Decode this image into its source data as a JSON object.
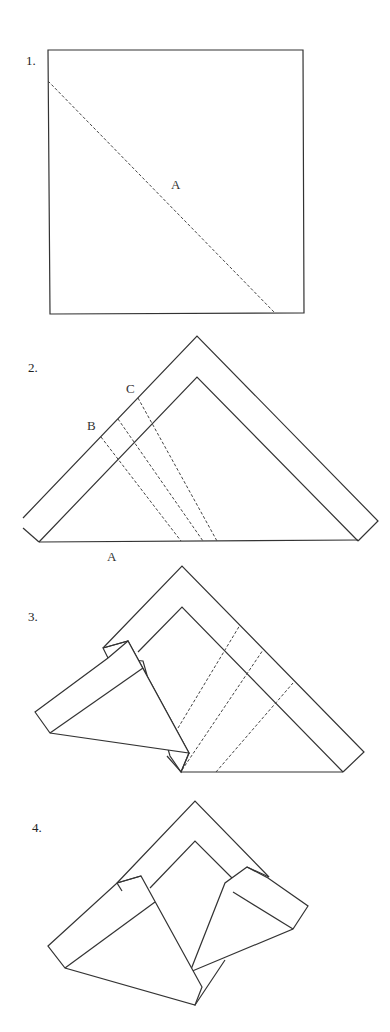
{
  "steps": [
    {
      "number": "1.",
      "labels": {
        "fold_a": "A"
      },
      "description": "Square with diagonal valley fold line A"
    },
    {
      "number": "2.",
      "labels": {
        "fold_a": "A",
        "fold_b": "B",
        "fold_c": "C"
      },
      "description": "Triangle folded along A with band; fold lines B and C"
    },
    {
      "number": "3.",
      "description": "Left corner folded over along B; dashed lines shown on right side"
    },
    {
      "number": "4.",
      "description": "Both corners folded in"
    }
  ],
  "colors": {
    "line": "#333333",
    "background": "#ffffff"
  }
}
